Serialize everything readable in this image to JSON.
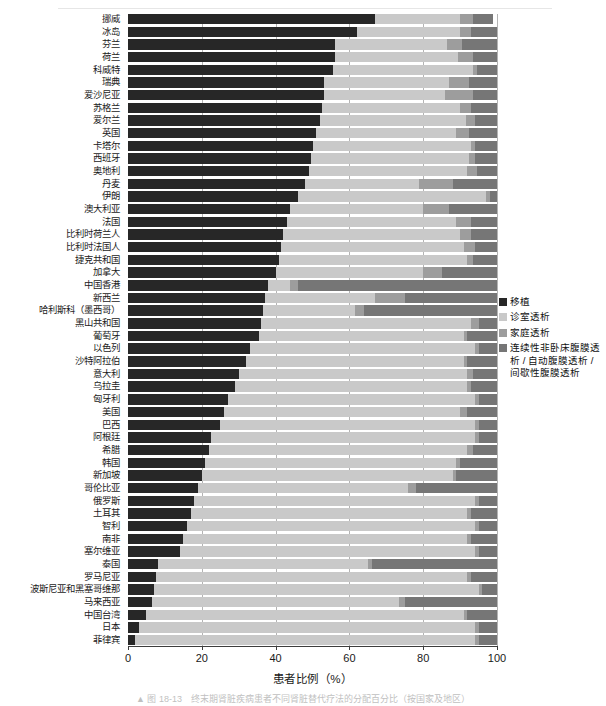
{
  "chart_data": {
    "type": "bar",
    "orientation": "horizontal",
    "stacked": true,
    "title": "",
    "xlabel": "患者比例（%）",
    "ylabel": "",
    "xlim": [
      0,
      100
    ],
    "xticks": [
      0,
      20,
      40,
      60,
      80,
      100
    ],
    "grid": true,
    "legend_position": "right",
    "series": [
      {
        "name": "移植",
        "color": "#272727",
        "key": "transplant"
      },
      {
        "name": "诊室透析",
        "color": "#c9c9c9",
        "key": "clinic"
      },
      {
        "name": "家庭透析",
        "color": "#9d9d9d",
        "key": "home"
      },
      {
        "name": "连续性非卧床腹膜透析 / 自动腹膜透析 / 间歇性腹膜透析",
        "color": "#767676",
        "key": "capd"
      }
    ],
    "categories": [
      "挪威",
      "冰岛",
      "芬兰",
      "荷兰",
      "科威特",
      "瑞典",
      "爱沙尼亚",
      "苏格兰",
      "爱尔兰",
      "英国",
      "卡塔尔",
      "西班牙",
      "奥地利",
      "丹麦",
      "伊朗",
      "澳大利亚",
      "法国",
      "比利时荷兰人",
      "比利时法国人",
      "捷克共和国",
      "加拿大",
      "中国香港",
      "新西兰",
      "哈利斯科（墨西哥）",
      "黑山共和国",
      "葡萄牙",
      "以色列",
      "沙特阿拉伯",
      "意大利",
      "乌拉圭",
      "匈牙利",
      "美国",
      "巴西",
      "阿根廷",
      "希腊",
      "韩国",
      "新加坡",
      "哥伦比亚",
      "俄罗斯",
      "土耳其",
      "智利",
      "南非",
      "塞尔维亚",
      "泰国",
      "罗马尼亚",
      "波斯尼亚和黑塞哥维那",
      "马来西亚",
      "中国台湾",
      "日本",
      "菲律宾"
    ],
    "rows": [
      {
        "label": "挪威",
        "transplant": 67.0,
        "clinic": 23.0,
        "home": 3.5,
        "capd": 5.5
      },
      {
        "label": "冰岛",
        "transplant": 62.0,
        "clinic": 28.0,
        "home": 3.0,
        "capd": 7.0
      },
      {
        "label": "芬兰",
        "transplant": 56.0,
        "clinic": 30.5,
        "home": 4.0,
        "capd": 9.5
      },
      {
        "label": "荷兰",
        "transplant": 56.0,
        "clinic": 33.5,
        "home": 4.0,
        "capd": 6.5
      },
      {
        "label": "科威特",
        "transplant": 55.5,
        "clinic": 38.0,
        "home": 1.0,
        "capd": 5.5
      },
      {
        "label": "瑞典",
        "transplant": 53.0,
        "clinic": 34.0,
        "home": 5.5,
        "capd": 7.5
      },
      {
        "label": "爱沙尼亚",
        "transplant": 53.0,
        "clinic": 33.0,
        "home": 7.5,
        "capd": 6.5
      },
      {
        "label": "苏格兰",
        "transplant": 52.5,
        "clinic": 37.5,
        "home": 3.0,
        "capd": 7.0
      },
      {
        "label": "爱尔兰",
        "transplant": 52.0,
        "clinic": 39.5,
        "home": 2.5,
        "capd": 6.0
      },
      {
        "label": "英国",
        "transplant": 51.0,
        "clinic": 38.0,
        "home": 3.5,
        "capd": 7.5
      },
      {
        "label": "卡塔尔",
        "transplant": 50.0,
        "clinic": 43.0,
        "home": 1.0,
        "capd": 6.0
      },
      {
        "label": "西班牙",
        "transplant": 49.5,
        "clinic": 43.0,
        "home": 1.5,
        "capd": 6.0
      },
      {
        "label": "奥地利",
        "transplant": 49.0,
        "clinic": 43.0,
        "home": 2.5,
        "capd": 5.5
      },
      {
        "label": "丹麦",
        "transplant": 48.0,
        "clinic": 31.0,
        "home": 9.0,
        "capd": 12.0
      },
      {
        "label": "伊朗",
        "transplant": 46.0,
        "clinic": 51.0,
        "home": 1.0,
        "capd": 2.0
      },
      {
        "label": "澳大利亚",
        "transplant": 44.0,
        "clinic": 36.0,
        "home": 7.0,
        "capd": 13.0
      },
      {
        "label": "法国",
        "transplant": 43.0,
        "clinic": 46.0,
        "home": 4.0,
        "capd": 7.0
      },
      {
        "label": "比利时荷兰人",
        "transplant": 42.0,
        "clinic": 48.0,
        "home": 3.0,
        "capd": 7.0
      },
      {
        "label": "比利时法国人",
        "transplant": 41.5,
        "clinic": 49.5,
        "home": 3.0,
        "capd": 6.0
      },
      {
        "label": "捷克共和国",
        "transplant": 41.0,
        "clinic": 51.0,
        "home": 1.5,
        "capd": 6.5
      },
      {
        "label": "加拿大",
        "transplant": 40.0,
        "clinic": 40.0,
        "home": 5.0,
        "capd": 15.0
      },
      {
        "label": "中国香港",
        "transplant": 38.0,
        "clinic": 6.0,
        "home": 2.0,
        "capd": 54.0
      },
      {
        "label": "新西兰",
        "transplant": 37.0,
        "clinic": 30.0,
        "home": 8.0,
        "capd": 25.0
      },
      {
        "label": "哈利斯科（墨西哥）",
        "transplant": 36.5,
        "clinic": 25.0,
        "home": 2.5,
        "capd": 36.0
      },
      {
        "label": "黑山共和国",
        "transplant": 36.0,
        "clinic": 57.0,
        "home": 2.0,
        "capd": 5.0
      },
      {
        "label": "葡萄牙",
        "transplant": 35.5,
        "clinic": 55.5,
        "home": 1.0,
        "capd": 8.0
      },
      {
        "label": "以色列",
        "transplant": 33.0,
        "clinic": 61.0,
        "home": 1.0,
        "capd": 5.0
      },
      {
        "label": "沙特阿拉伯",
        "transplant": 32.0,
        "clinic": 59.0,
        "home": 1.0,
        "capd": 8.0
      },
      {
        "label": "意大利",
        "transplant": 30.0,
        "clinic": 62.0,
        "home": 1.5,
        "capd": 6.5
      },
      {
        "label": "乌拉圭",
        "transplant": 29.0,
        "clinic": 63.0,
        "home": 1.0,
        "capd": 7.0
      },
      {
        "label": "匈牙利",
        "transplant": 27.0,
        "clinic": 67.0,
        "home": 1.0,
        "capd": 5.0
      },
      {
        "label": "美国",
        "transplant": 26.0,
        "clinic": 64.0,
        "home": 2.0,
        "capd": 8.0
      },
      {
        "label": "巴西",
        "transplant": 25.0,
        "clinic": 69.0,
        "home": 1.0,
        "capd": 5.0
      },
      {
        "label": "阿根廷",
        "transplant": 22.5,
        "clinic": 71.5,
        "home": 1.0,
        "capd": 5.0
      },
      {
        "label": "希腊",
        "transplant": 22.0,
        "clinic": 70.0,
        "home": 1.5,
        "capd": 6.5
      },
      {
        "label": "韩国",
        "transplant": 21.0,
        "clinic": 68.0,
        "home": 1.0,
        "capd": 10.0
      },
      {
        "label": "新加坡",
        "transplant": 20.0,
        "clinic": 68.0,
        "home": 1.0,
        "capd": 11.0
      },
      {
        "label": "哥伦比亚",
        "transplant": 19.0,
        "clinic": 57.0,
        "home": 2.0,
        "capd": 22.0
      },
      {
        "label": "俄罗斯",
        "transplant": 18.0,
        "clinic": 76.0,
        "home": 1.0,
        "capd": 5.0
      },
      {
        "label": "土耳其",
        "transplant": 17.0,
        "clinic": 75.0,
        "home": 1.0,
        "capd": 7.0
      },
      {
        "label": "智利",
        "transplant": 16.0,
        "clinic": 78.0,
        "home": 1.0,
        "capd": 5.0
      },
      {
        "label": "南非",
        "transplant": 15.0,
        "clinic": 77.0,
        "home": 1.0,
        "capd": 7.0
      },
      {
        "label": "塞尔维亚",
        "transplant": 14.0,
        "clinic": 80.0,
        "home": 1.0,
        "capd": 5.0
      },
      {
        "label": "泰国",
        "transplant": 8.0,
        "clinic": 57.0,
        "home": 1.0,
        "capd": 34.0
      },
      {
        "label": "罗马尼亚",
        "transplant": 7.5,
        "clinic": 84.5,
        "home": 1.0,
        "capd": 7.0
      },
      {
        "label": "波斯尼亚和黑塞哥维那",
        "transplant": 7.0,
        "clinic": 88.0,
        "home": 1.0,
        "capd": 4.0
      },
      {
        "label": "马来西亚",
        "transplant": 6.5,
        "clinic": 67.0,
        "home": 1.5,
        "capd": 25.0
      },
      {
        "label": "中国台湾",
        "transplant": 5.0,
        "clinic": 86.0,
        "home": 1.0,
        "capd": 8.0
      },
      {
        "label": "日本",
        "transplant": 3.0,
        "clinic": 91.0,
        "home": 1.0,
        "capd": 5.0
      },
      {
        "label": "菲律宾",
        "transplant": 2.0,
        "clinic": 92.0,
        "home": 1.0,
        "capd": 5.0
      }
    ]
  },
  "axis": {
    "x_title": "患者比例（%）",
    "ticks": [
      "0",
      "20",
      "40",
      "60",
      "80",
      "100"
    ]
  },
  "legend": {
    "items": [
      {
        "label": "移植",
        "color": "#272727"
      },
      {
        "label": "诊室透析",
        "color": "#c9c9c9"
      },
      {
        "label": "家庭透析",
        "color": "#9d9d9d"
      },
      {
        "label": "连续性非卧床腹膜透析 / 自动腹膜透析 / 间歇性腹膜透析",
        "color": "#767676"
      }
    ]
  },
  "caption": "▲ 图 18-13　终末期肾脏疾病患者不同肾脏替代疗法的分配百分比（按国家及地区）"
}
